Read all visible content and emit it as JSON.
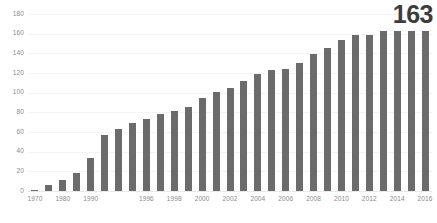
{
  "chart_data": {
    "type": "bar",
    "title": "",
    "subtitle": "",
    "xlabel": "",
    "ylabel": "",
    "ylim": [
      0,
      180
    ],
    "yticks": [
      0,
      20,
      40,
      60,
      80,
      100,
      120,
      140,
      160,
      180
    ],
    "ytick_labels": [
      "0",
      "20",
      "40",
      "60",
      "80",
      "100",
      "120",
      "140",
      "160",
      "180"
    ],
    "grid": true,
    "legend": false,
    "legend_position": "none",
    "bar_color": "#6b6b6b",
    "categories": [
      "1970",
      "1975",
      "1980",
      "1985",
      "1990",
      "1993",
      "1994",
      "1995",
      "1996",
      "1997",
      "1998",
      "1999",
      "2000",
      "2001",
      "2002",
      "2003",
      "2004",
      "2005",
      "2006",
      "2007",
      "2008",
      "2009",
      "2010",
      "2011",
      "2012",
      "2013",
      "2014",
      "2015",
      "2016"
    ],
    "values": [
      1,
      6,
      11,
      18,
      34,
      57,
      63,
      69,
      73,
      78,
      81,
      85,
      95,
      101,
      105,
      112,
      119,
      123,
      124,
      130,
      139,
      145,
      154,
      159,
      159,
      163,
      163,
      163,
      163
    ],
    "xtick_labels": [
      "1970",
      "1980",
      "1990",
      "1996",
      "1998",
      "2000",
      "2002",
      "2004",
      "2006",
      "2008",
      "2010",
      "2012",
      "2014",
      "2016"
    ],
    "xtick_categories": [
      "1970",
      "1980",
      "1990",
      "1996",
      "1998",
      "2000",
      "2002",
      "2004",
      "2006",
      "2008",
      "2010",
      "2012",
      "2014",
      "2016"
    ],
    "annotations": [
      {
        "name": "final-value-callout",
        "text": "163",
        "target_category": "2016",
        "value": 163
      }
    ]
  }
}
